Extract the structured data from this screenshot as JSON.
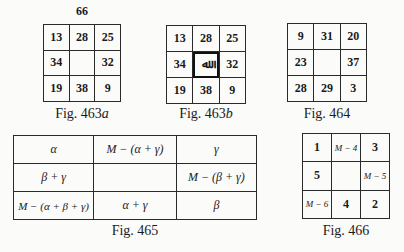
{
  "figures": {
    "fig463a": {
      "top_label": "66",
      "rows": [
        [
          "13",
          "28",
          "25"
        ],
        [
          "34",
          "",
          "32"
        ],
        [
          "19",
          "38",
          "9"
        ]
      ],
      "caption_prefix": "Fig. 463",
      "caption_suffix": "a"
    },
    "fig463b": {
      "rows": [
        [
          "13",
          "28",
          "25"
        ],
        [
          "34",
          "ﷲ",
          "32"
        ],
        [
          "19",
          "38",
          "9"
        ]
      ],
      "center_symbol": "allah-calligraphy",
      "caption_prefix": "Fig. 463",
      "caption_suffix": "b"
    },
    "fig464": {
      "rows": [
        [
          "9",
          "31",
          "20"
        ],
        [
          "23",
          "",
          "37"
        ],
        [
          "28",
          "29",
          "3"
        ]
      ],
      "caption": "Fig. 464"
    },
    "fig465": {
      "rows": [
        [
          "α",
          "M − (α + γ)",
          "γ"
        ],
        [
          "β + γ",
          "",
          "M − (β + γ)"
        ],
        [
          "M − (α + β + γ)",
          "α + γ",
          "β"
        ]
      ],
      "caption": "Fig. 465"
    },
    "fig466": {
      "rows": [
        [
          "1",
          "M − 4",
          "3"
        ],
        [
          "5",
          "",
          "M − 5"
        ],
        [
          "M − 6",
          "4",
          "2"
        ]
      ],
      "caption": "Fig. 466"
    }
  }
}
